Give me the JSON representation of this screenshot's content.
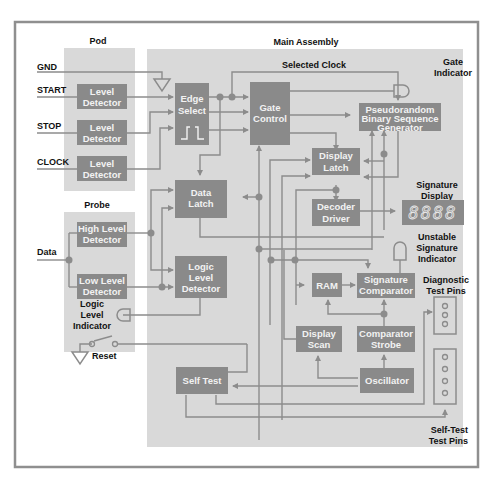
{
  "sections": {
    "pod": "Pod",
    "main": "Main Assembly",
    "probe": "Probe"
  },
  "inputs": {
    "gnd": "GND",
    "start": "START",
    "stop": "STOP",
    "clock": "CLOCK",
    "data": "Data"
  },
  "blocks": {
    "level_detector_1": [
      "Level",
      "Detector"
    ],
    "level_detector_2": [
      "Level",
      "Detector"
    ],
    "level_detector_3": [
      "Level",
      "Detector"
    ],
    "edge_select": [
      "Edge",
      "Select"
    ],
    "gate_control": [
      "Gate",
      "Control"
    ],
    "prbs": [
      "Pseudorandom",
      "Binary Sequence",
      "Generator"
    ],
    "display_latch": [
      "Display",
      "Latch"
    ],
    "data_latch": [
      "Data",
      "Latch"
    ],
    "decoder_driver": [
      "Decoder",
      "Driver"
    ],
    "high_level_detector": [
      "High Level",
      "Detector"
    ],
    "low_level_detector": [
      "Low Level",
      "Detector"
    ],
    "logic_level_detector": [
      "Logic",
      "Level",
      "Detector"
    ],
    "ram": [
      "RAM"
    ],
    "signature_comparator": [
      "Signature",
      "Comparator"
    ],
    "display_scan": [
      "Display",
      "Scan"
    ],
    "comparator_strobe": [
      "Comparator",
      "Strobe"
    ],
    "oscillator": [
      "Oscillator"
    ],
    "self_test": [
      "Self Test"
    ]
  },
  "labels": {
    "selected_clock": "Selected Clock",
    "gate_indicator": [
      "Gate",
      "Indicator"
    ],
    "signature_display": [
      "Signature",
      "Display"
    ],
    "signature_digits": "8888",
    "unstable_indicator": [
      "Unstable",
      "Signature",
      "Indicator"
    ],
    "diagnostic_pins": [
      "Diagnostic",
      "Test Pins"
    ],
    "logic_level_indicator": [
      "Logic",
      "Level",
      "Indicator"
    ],
    "reset": "Reset",
    "selftest_pins": [
      "Self-Test",
      "Test Pins"
    ]
  },
  "colors": {
    "frame": "#8f8f8f",
    "panel": "#d9d9d9",
    "block": "#8a8a8a",
    "wire": "#8c8c8c",
    "block_text": "#f2f2f2",
    "label_text": "#111111"
  }
}
